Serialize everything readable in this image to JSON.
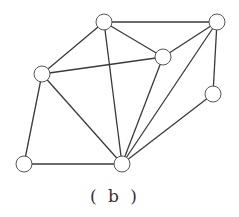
{
  "diagram": {
    "caption": "( b )",
    "node_radius": 8,
    "colors": {
      "edge": "#3a3a3a",
      "node_stroke": "#555555",
      "node_fill": "#ffffff"
    },
    "nodes": [
      {
        "id": "top",
        "x": 104,
        "y": 22
      },
      {
        "id": "top-right",
        "x": 217,
        "y": 22
      },
      {
        "id": "mid-right",
        "x": 163,
        "y": 57
      },
      {
        "id": "left",
        "x": 42,
        "y": 74
      },
      {
        "id": "right",
        "x": 213,
        "y": 94
      },
      {
        "id": "bottom-left",
        "x": 24,
        "y": 164
      },
      {
        "id": "bottom-center",
        "x": 122,
        "y": 164
      }
    ],
    "edges": [
      [
        "top",
        "top-right"
      ],
      [
        "top",
        "left"
      ],
      [
        "top",
        "mid-right"
      ],
      [
        "top",
        "bottom-center"
      ],
      [
        "top-right",
        "mid-right"
      ],
      [
        "top-right",
        "right"
      ],
      [
        "top-right",
        "bottom-center"
      ],
      [
        "left",
        "mid-right"
      ],
      [
        "left",
        "bottom-left"
      ],
      [
        "left",
        "bottom-center"
      ],
      [
        "mid-right",
        "bottom-center"
      ],
      [
        "right",
        "bottom-center"
      ],
      [
        "bottom-left",
        "bottom-center"
      ]
    ]
  }
}
